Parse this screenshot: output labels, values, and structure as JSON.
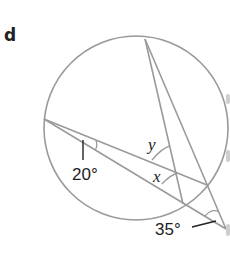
{
  "part_label": "d",
  "angles": {
    "given_1": "20°",
    "given_2": "35°",
    "unknown_x": "x",
    "unknown_y": "y"
  },
  "colors": {
    "line": "#9a9a9a",
    "text": "#222222",
    "leader": "#222222"
  }
}
